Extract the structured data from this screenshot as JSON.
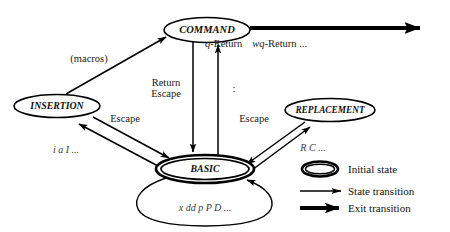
{
  "diagram": {
    "nodes": [
      {
        "id": "command",
        "label": "COMMAND",
        "kind": "state"
      },
      {
        "id": "insertion",
        "label": "INSERTION",
        "kind": "state"
      },
      {
        "id": "replacement",
        "label": "REPLACEMENT",
        "kind": "state"
      },
      {
        "id": "basic",
        "label": "BASIC",
        "kind": "initial-state"
      }
    ],
    "edges": [
      {
        "id": "insertion-to-command",
        "from": "INSERTION",
        "to": "COMMAND",
        "label": "(macros)",
        "style": "state-transition"
      },
      {
        "id": "command-to-basic",
        "from": "COMMAND",
        "to": "BASIC",
        "label_line1": "Return",
        "label_line2": "Escape",
        "style": "state-transition"
      },
      {
        "id": "basic-to-command",
        "from": "BASIC",
        "to": "COMMAND",
        "label": ":",
        "style": "state-transition"
      },
      {
        "id": "basic-to-insertion",
        "from": "BASIC",
        "to": "INSERTION",
        "label": "i  a  I ...",
        "style": "state-transition"
      },
      {
        "id": "insertion-to-basic",
        "from": "INSERTION",
        "to": "BASIC",
        "label": "Escape",
        "style": "state-transition"
      },
      {
        "id": "basic-to-replacement",
        "from": "BASIC",
        "to": "REPLACEMENT",
        "label": "R  C ...",
        "style": "state-transition"
      },
      {
        "id": "replacement-to-basic",
        "from": "REPLACEMENT",
        "to": "BASIC",
        "label": "Escape",
        "style": "state-transition"
      },
      {
        "id": "basic-self-loop",
        "from": "BASIC",
        "to": "BASIC",
        "label": "x  dd  p  P  D ...",
        "style": "state-transition"
      },
      {
        "id": "command-exit",
        "from": "COMMAND",
        "to": "exit",
        "label_italic1": "q",
        "label_rest1": "-Return",
        "label_italic2": "wq",
        "label_rest2": "-Return ...",
        "style": "exit-transition"
      }
    ]
  },
  "legend": {
    "items": [
      {
        "id": "initial-state",
        "symbol": "double-ellipse",
        "label": "Initial state"
      },
      {
        "id": "state-transition",
        "symbol": "thin-arrow",
        "label": "State transition"
      },
      {
        "id": "exit-transition",
        "symbol": "thick-arrow",
        "label": "Exit transition"
      }
    ]
  },
  "colors": {
    "stroke": "#000000",
    "text": "#101010",
    "key_text": "#3a3a3a",
    "background": "#ffffff"
  }
}
